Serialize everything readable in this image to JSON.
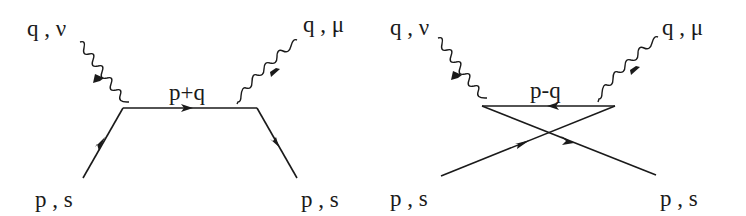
{
  "diagrams": [
    {
      "name": "direct",
      "labels": {
        "photon_in": "q , ν",
        "photon_out": "q , μ",
        "internal": "p+q",
        "fermion_in": "p , s",
        "fermion_out": "p , s"
      }
    },
    {
      "name": "crossed",
      "labels": {
        "photon_in": "q , ν",
        "photon_out": "q , μ",
        "internal": "p-q",
        "fermion_in": "p , s",
        "fermion_out": "p , s"
      }
    }
  ],
  "colors": {
    "ink": "#1a1a1a",
    "background": "#ffffff"
  }
}
